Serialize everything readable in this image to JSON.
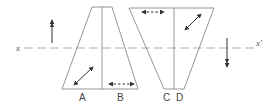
{
  "diagram": {
    "type": "optical/geometric trapezoid diagram",
    "axis": {
      "start_label": "x",
      "end_label": "x'"
    },
    "labels": {
      "A": "A",
      "B": "B",
      "C": "C",
      "D": "D"
    },
    "shapes": [
      {
        "name": "left-trapezoid",
        "orientation": "narrow-top",
        "halves": [
          "A",
          "B"
        ]
      },
      {
        "name": "right-trapezoid",
        "orientation": "wide-top",
        "halves": [
          "C",
          "D"
        ]
      }
    ],
    "arrows": [
      {
        "name": "up-arrow",
        "location": "left of axis, above",
        "direction": "up"
      },
      {
        "name": "down-arrow",
        "location": "right of axis, below",
        "direction": "down"
      },
      {
        "name": "diagonal-arrow-A",
        "location": "region A",
        "style": "solid double-headed diagonal"
      },
      {
        "name": "horizontal-arrow-B",
        "location": "region B",
        "style": "dashed double-headed horizontal"
      },
      {
        "name": "horizontal-arrow-C",
        "location": "top-left of right trapezoid",
        "style": "dashed double-headed horizontal"
      },
      {
        "name": "diagonal-arrow-D",
        "location": "top-right of right trapezoid",
        "style": "solid double-headed diagonal"
      }
    ],
    "colors": {
      "line": "#8a8a8a",
      "arrow": "#333333",
      "text": "#444444"
    }
  }
}
